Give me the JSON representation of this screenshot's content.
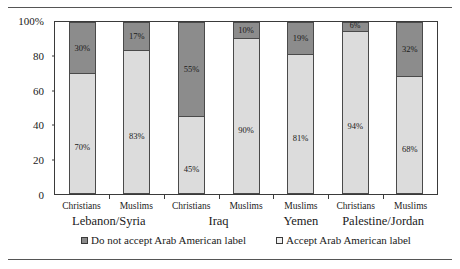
{
  "chart_data": {
    "type": "bar",
    "subtype": "stacked-percentage",
    "title": "",
    "xlabel": "",
    "ylabel": "",
    "ylim": [
      0,
      100
    ],
    "ytick_labels": [
      "100%",
      "80",
      "60",
      "40",
      "20",
      "0"
    ],
    "ytick_values": [
      100,
      80,
      60,
      40,
      20,
      0
    ],
    "grid": false,
    "legend_position": "bottom",
    "categories": [
      "Christians",
      "Muslims",
      "Christians",
      "Muslims",
      "Muslims",
      "Christians",
      "Muslims"
    ],
    "groups": [
      {
        "label": "Lebanon/Syria",
        "start": 0,
        "span": 2
      },
      {
        "label": "Iraq",
        "start": 2,
        "span": 2
      },
      {
        "label": "Yemen",
        "start": 4,
        "span": 1
      },
      {
        "label": "Palestine/Jordan",
        "start": 5,
        "span": 2
      }
    ],
    "series": [
      {
        "name": "Do not accept Arab American label",
        "color": "#8c8c8c",
        "values": [
          30,
          17,
          55,
          10,
          19,
          6,
          32
        ],
        "labels": [
          "30%",
          "17%",
          "55%",
          "10%",
          "19%",
          "6%",
          "32%"
        ]
      },
      {
        "name": "Accept Arab American label",
        "color": "#dcdcdc",
        "values": [
          70,
          83,
          45,
          90,
          81,
          94,
          68
        ],
        "labels": [
          "70%",
          "83%",
          "45%",
          "90%",
          "81%",
          "94%",
          "68%"
        ]
      }
    ],
    "legend": [
      {
        "label": "Do not accept Arab American label",
        "swatch": "dark"
      },
      {
        "label": "Accept Arab American label",
        "swatch": "light"
      }
    ]
  }
}
